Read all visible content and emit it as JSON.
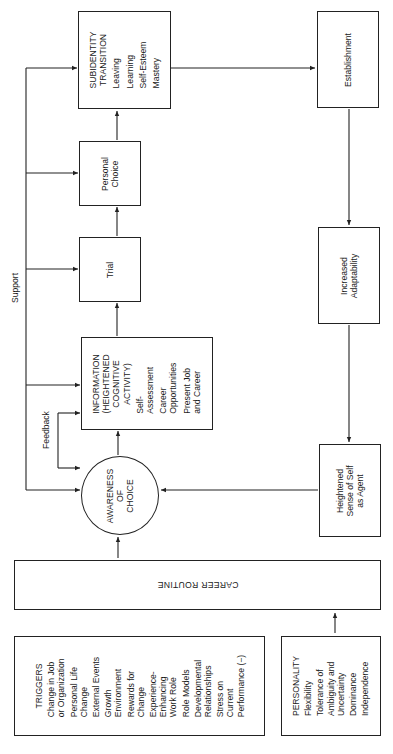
{
  "diagram": {
    "nodes": {
      "subidentity_transition": {
        "title_lines": [
          "SUBIDENTITY",
          "TRANSITION"
        ],
        "items": [
          "Leaving",
          "Learning",
          "Self-Esteem",
          "Mastery"
        ]
      },
      "personal_choice": {
        "lines": [
          "Personal",
          "Choice"
        ]
      },
      "trial": {
        "lines": [
          "Trial"
        ]
      },
      "information": {
        "title_lines": [
          "INFORMATION",
          "(HEIGHTENED",
          "COGNITIVE",
          "ACTIVITY)"
        ],
        "items": [
          [
            "Self-",
            "Assessment"
          ],
          [
            "Career",
            "Opportunities"
          ],
          [
            "Present Job",
            "and Career"
          ]
        ]
      },
      "awareness_of_choice": {
        "lines": [
          "AWARENESS",
          "OF",
          "CHOICE"
        ]
      },
      "establishment": {
        "lines": [
          "Establishment"
        ]
      },
      "increased_adaptability": {
        "lines": [
          "Increased",
          "Adaptability"
        ]
      },
      "heightened_sense": {
        "lines": [
          "Heightened",
          "Sense of Self",
          "as Agent"
        ]
      },
      "career_routine": {
        "label": "CAREER ROUTINE"
      },
      "triggers": {
        "title": "TRIGGERS",
        "items": [
          [
            "Change in Job",
            "or Organization"
          ],
          [
            "Personal Life",
            "Change"
          ],
          [
            "External Events"
          ],
          [
            "Growth",
            "Environment"
          ],
          [
            "Rewards for",
            "Change"
          ],
          [
            "Experience-",
            "Enhancing",
            "Work Role"
          ],
          [
            "Role Models"
          ],
          [
            "Developmental",
            "Relationships"
          ],
          [
            "Stress on",
            "Current",
            "Performance (−)"
          ]
        ]
      },
      "personality": {
        "title": "PERSONALITY",
        "items": [
          [
            "Flexibility"
          ],
          [
            "Tolerance of",
            "Ambiguity and",
            "Uncertainty"
          ],
          [
            "Dominance"
          ],
          [
            "Independence"
          ]
        ]
      }
    },
    "edge_labels": {
      "support": "Support",
      "feedback": "Feedback"
    },
    "colors": {
      "line": "#222222",
      "background": "#ffffff"
    }
  }
}
